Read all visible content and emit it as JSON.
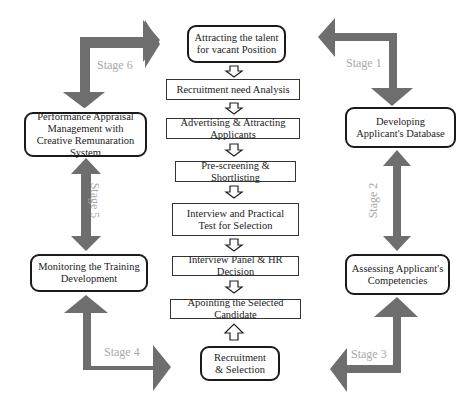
{
  "diagram": {
    "center_top": "Attracting the talent for vacant Position",
    "process_steps": [
      "Recruitment need Analysis",
      "Advertising & Attracting Applicants",
      "Pre-screening & Shortlisting",
      "Interview and Practical Test for Selection",
      "Interview Panel & HR Decision",
      "Apointing the Selected Candidate"
    ],
    "center_bottom": "Recruitment & Selection",
    "left_top": "Performance Appraisal Management with Creative Remunaration System",
    "left_bottom": "Monitoring the Training Development",
    "right_top": "Developing Applicant's Database",
    "right_bottom": "Assessing Applicant's Competencies",
    "stages": [
      "Stage 1",
      "Stage 2",
      "Stage 3",
      "Stage 4",
      "Stage 5",
      "Stage 6"
    ],
    "colors": {
      "arrow_fill": "#6e6e6e",
      "stage_label": "#a8a8a8",
      "border": "#1a1a1a"
    }
  }
}
